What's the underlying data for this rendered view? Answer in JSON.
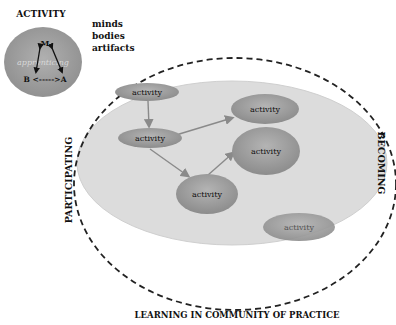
{
  "activity_panel": {
    "title": "ACTIVITY",
    "top_vertex": "M",
    "bottom_relation": "B <----->A",
    "watermark": "apprenticing",
    "labels": [
      "minds",
      "bodies",
      "artifacts"
    ]
  },
  "main": {
    "left_label": "PARTICIPATING",
    "right_label": "BECOMING",
    "bottom_label": "LEARNING IN COMMUNITY OF PRACTICE",
    "nodes": [
      {
        "label": "activity"
      },
      {
        "label": "activity"
      },
      {
        "label": "activity"
      },
      {
        "label": "activity"
      },
      {
        "label": "activity"
      },
      {
        "label": "activity"
      }
    ]
  },
  "colors": {
    "node_fill": "#9a9a9a",
    "community_fill": "#dcdcdc",
    "dashed_border": "#222222",
    "arrow": "#8a8a8a",
    "text": "#111111"
  }
}
